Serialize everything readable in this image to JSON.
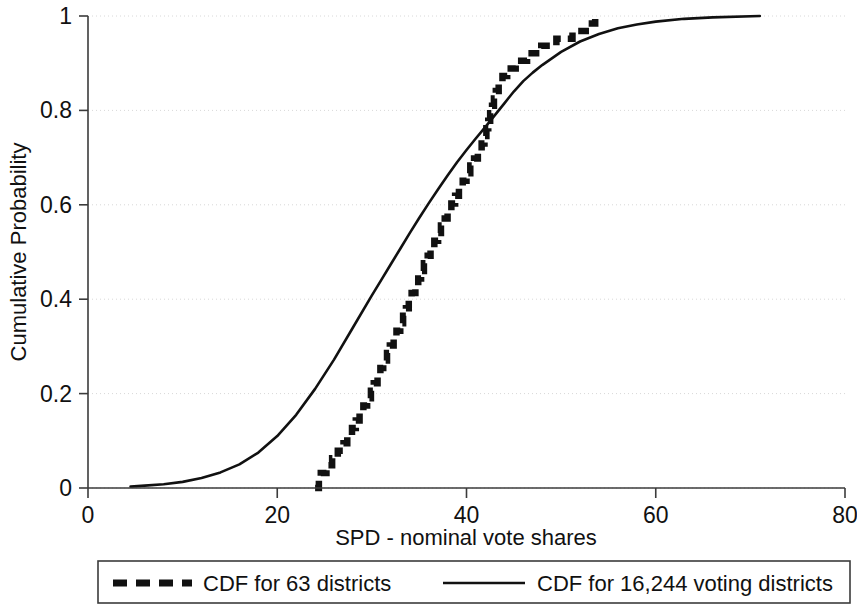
{
  "chart_data": {
    "type": "line",
    "title": "",
    "xlabel": "SPD - nominal vote shares",
    "ylabel": "Cumulative Probability",
    "xlim": [
      0,
      80
    ],
    "ylim": [
      0,
      1
    ],
    "xticks": [
      "0",
      "20",
      "40",
      "60",
      "80"
    ],
    "xtick_values": [
      0,
      20,
      40,
      60,
      80
    ],
    "yticks": [
      "0",
      "0.2",
      "0.4",
      "0.6",
      "0.8",
      "1"
    ],
    "ytick_values": [
      0,
      0.2,
      0.4,
      0.6,
      0.8,
      1
    ],
    "grid": "horizontal-dotted",
    "legend_position": "bottom",
    "series": [
      {
        "name": "CDF for 63 districts",
        "style": "dashed",
        "color": "#111111",
        "x": [
          24.0,
          24.4,
          24.6,
          25.2,
          25.8,
          26.4,
          27.0,
          27.4,
          27.9,
          28.3,
          28.7,
          29.1,
          29.5,
          29.9,
          30.2,
          30.6,
          30.9,
          31.2,
          31.6,
          31.9,
          32.3,
          32.6,
          33.0,
          33.3,
          33.6,
          33.9,
          34.2,
          34.6,
          34.9,
          35.2,
          35.5,
          35.9,
          36.2,
          36.6,
          37.0,
          37.3,
          37.7,
          38.0,
          38.4,
          38.8,
          39.2,
          39.6,
          40.0,
          40.4,
          40.8,
          41.2,
          41.6,
          41.9,
          42.1,
          42.3,
          42.5,
          42.7,
          42.9,
          43.1,
          43.4,
          43.8,
          44.3,
          45.2,
          46.4,
          47.9,
          49.5,
          51.2,
          52.6,
          53.6
        ],
        "y": [
          0.0,
          0.016,
          0.032,
          0.048,
          0.063,
          0.079,
          0.095,
          0.111,
          0.127,
          0.143,
          0.159,
          0.175,
          0.19,
          0.206,
          0.222,
          0.238,
          0.254,
          0.27,
          0.286,
          0.302,
          0.317,
          0.333,
          0.349,
          0.365,
          0.381,
          0.397,
          0.413,
          0.429,
          0.444,
          0.46,
          0.476,
          0.492,
          0.508,
          0.524,
          0.54,
          0.556,
          0.571,
          0.587,
          0.603,
          0.619,
          0.635,
          0.651,
          0.667,
          0.683,
          0.698,
          0.714,
          0.73,
          0.746,
          0.762,
          0.778,
          0.794,
          0.81,
          0.825,
          0.841,
          0.857,
          0.873,
          0.889,
          0.905,
          0.921,
          0.937,
          0.952,
          0.968,
          0.984,
          1.0
        ]
      },
      {
        "name": "CDF for 16,244 voting districts",
        "style": "solid",
        "color": "#111111",
        "x": [
          4.5,
          6.0,
          8.0,
          10.0,
          12.0,
          14.0,
          16.0,
          18.0,
          20.0,
          22.0,
          24.0,
          26.0,
          28.0,
          30.0,
          31.0,
          32.0,
          33.0,
          34.0,
          35.0,
          36.0,
          37.0,
          38.0,
          39.0,
          40.0,
          41.0,
          42.0,
          43.0,
          44.0,
          45.0,
          46.0,
          47.0,
          48.0,
          50.0,
          52.0,
          54.0,
          56.0,
          58.0,
          60.0,
          63.0,
          66.0,
          71.0
        ],
        "y": [
          0.003,
          0.005,
          0.008,
          0.013,
          0.021,
          0.033,
          0.05,
          0.075,
          0.11,
          0.155,
          0.21,
          0.272,
          0.34,
          0.408,
          0.441,
          0.474,
          0.507,
          0.54,
          0.572,
          0.603,
          0.633,
          0.662,
          0.69,
          0.716,
          0.741,
          0.765,
          0.79,
          0.815,
          0.84,
          0.862,
          0.88,
          0.896,
          0.924,
          0.946,
          0.962,
          0.974,
          0.982,
          0.988,
          0.994,
          0.997,
          1.0
        ]
      }
    ]
  },
  "legend": {
    "entry1_label": "CDF for 63 districts",
    "entry2_label": "CDF for 16,244 voting districts"
  },
  "axes": {
    "x_title": "SPD - nominal vote shares",
    "y_title": "Cumulative Probability"
  }
}
